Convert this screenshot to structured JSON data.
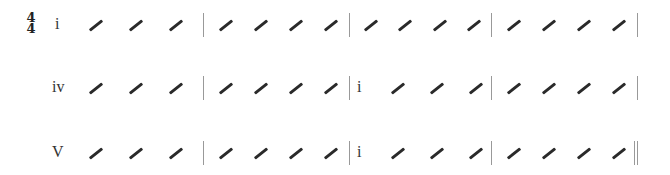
{
  "time_signature": {
    "top": "4",
    "bottom": "4"
  },
  "rows": [
    {
      "y": 25,
      "measures": [
        {
          "chord": "i",
          "beats": 4
        },
        {
          "chord": "",
          "beats": 4
        },
        {
          "chord": "",
          "beats": 4
        },
        {
          "chord": "",
          "beats": 4
        }
      ],
      "end_barline": "single"
    },
    {
      "y": 88,
      "measures": [
        {
          "chord": "iv",
          "beats": 4
        },
        {
          "chord": "",
          "beats": 4
        },
        {
          "chord": "i",
          "beats": 4
        },
        {
          "chord": "",
          "beats": 4
        }
      ],
      "end_barline": "single"
    },
    {
      "y": 153,
      "measures": [
        {
          "chord": "V",
          "beats": 4
        },
        {
          "chord": "",
          "beats": 4
        },
        {
          "chord": "i",
          "beats": 4
        },
        {
          "chord": "",
          "beats": 4
        }
      ],
      "end_barline": "final-double"
    }
  ]
}
